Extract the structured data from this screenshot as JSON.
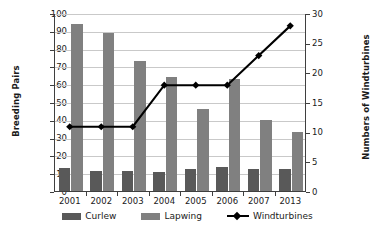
{
  "chart_data": {
    "type": "bar",
    "title": "",
    "subtitle": "",
    "xlabel": "",
    "ylabel": "Breeding Pairs",
    "y2label": "Numbers of Windturbines",
    "categories": [
      "2001",
      "2002",
      "2003",
      "2004",
      "2005",
      "2006",
      "2007",
      "2013"
    ],
    "series": [
      {
        "name": "Curlew",
        "type": "bar",
        "axis": "left",
        "color": "#595959",
        "values": [
          13,
          11,
          11,
          10.5,
          12.5,
          13.5,
          12.5,
          12.5
        ]
      },
      {
        "name": "Lapwing",
        "type": "bar",
        "axis": "left",
        "color": "#808080",
        "values": [
          94,
          89,
          73,
          64,
          46,
          63,
          40,
          33
        ]
      },
      {
        "name": "Windturbines",
        "type": "line",
        "axis": "right",
        "color": "#000000",
        "marker": "diamond",
        "values": [
          11,
          11,
          11,
          18,
          18,
          18,
          23,
          28
        ]
      }
    ],
    "ylim": [
      0,
      100
    ],
    "y2lim": [
      0,
      30
    ],
    "yticks": [
      "0",
      "10",
      "20",
      "30",
      "40",
      "50",
      "60",
      "70",
      "80",
      "90",
      "100"
    ],
    "y2ticks": [
      "0",
      "5",
      "10",
      "15",
      "20",
      "25",
      "30"
    ],
    "grid": "horizontal",
    "legend_position": "bottom",
    "legend": [
      {
        "label": "Curlew",
        "marker": "swatch",
        "color": "#595959"
      },
      {
        "label": "Lapwing",
        "marker": "swatch",
        "color": "#808080"
      },
      {
        "label": "Windturbines",
        "marker": "line-diamond",
        "color": "#000000"
      }
    ],
    "colors": {
      "curlew": "#595959",
      "lapwing": "#808080",
      "windturbines": "#000000",
      "gridline": "#c9c9c9",
      "axis": "#3f3f3f",
      "background": "#ffffff",
      "text": "#1a1a1a"
    }
  }
}
